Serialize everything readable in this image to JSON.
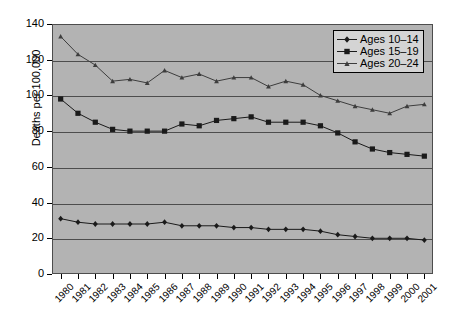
{
  "chart_data": {
    "type": "line",
    "title": "",
    "xlabel": "",
    "ylabel": "Deaths per 100,000",
    "ylim": [
      0,
      140
    ],
    "ytick_labels": [
      "0",
      "20",
      "40",
      "60",
      "80",
      "100",
      "120",
      "140"
    ],
    "ytick_values": [
      0,
      20,
      40,
      60,
      80,
      100,
      120,
      140
    ],
    "grid": "horizontal",
    "legend_position": "upper-right",
    "categories": [
      "1980",
      "1981",
      "1982",
      "1983",
      "1984",
      "1985",
      "1986",
      "1987",
      "1988",
      "1989",
      "1990",
      "1991",
      "1992",
      "1993",
      "1994",
      "1995",
      "1996",
      "1997",
      "1998",
      "1999",
      "2000",
      "2001"
    ],
    "x": [
      1980,
      1981,
      1982,
      1983,
      1984,
      1985,
      1986,
      1987,
      1988,
      1989,
      1990,
      1991,
      1992,
      1993,
      1994,
      1995,
      1996,
      1997,
      1998,
      1999,
      2000,
      2001
    ],
    "series": [
      {
        "name": "Ages 10-14",
        "marker": "diamond",
        "color": "#1a1a1a",
        "values": [
          31,
          29,
          28,
          28,
          28,
          28,
          29,
          27,
          27,
          27,
          26,
          26,
          25,
          25,
          25,
          24,
          22,
          21,
          20,
          20,
          20,
          19
        ]
      },
      {
        "name": "Ages 15-19",
        "marker": "square",
        "color": "#1a1a1a",
        "values": [
          98,
          90,
          85,
          81,
          80,
          80,
          80,
          84,
          83,
          86,
          87,
          88,
          85,
          85,
          85,
          83,
          79,
          74,
          70,
          68,
          67,
          66
        ]
      },
      {
        "name": "Ages 20-24",
        "marker": "triangle",
        "color": "#3d3d3d",
        "values": [
          133,
          123,
          117,
          108,
          109,
          107,
          114,
          110,
          112,
          108,
          110,
          110,
          105,
          108,
          106,
          100,
          97,
          94,
          92,
          90,
          94,
          95
        ]
      }
    ]
  },
  "legend": {
    "items": [
      {
        "label": "Ages 10–14"
      },
      {
        "label": "Ages 15–19"
      },
      {
        "label": "Ages 20–24"
      }
    ]
  },
  "axes": {
    "y_title": "Deaths per 100,000"
  }
}
